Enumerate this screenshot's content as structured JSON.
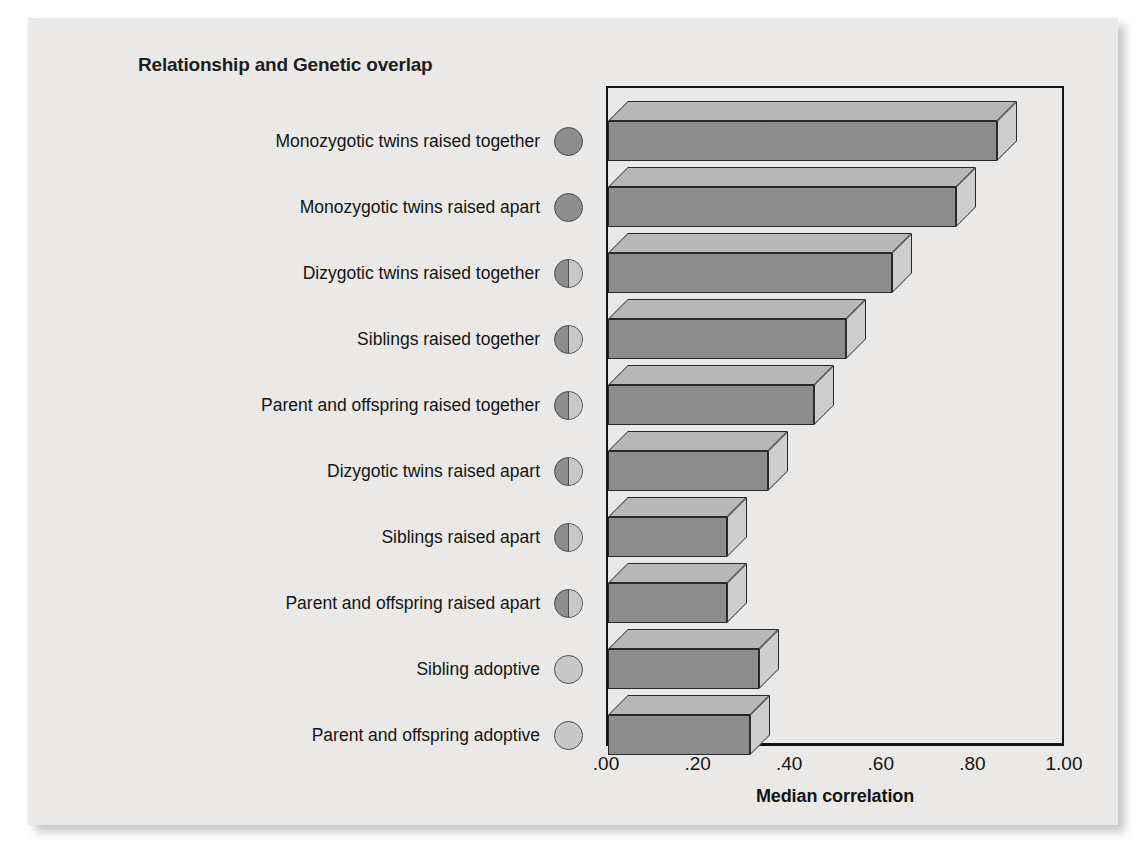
{
  "figure": {
    "legend_title": "Relationship and Genetic overlap",
    "xaxis_title": "Median correlation"
  },
  "xticks": [
    ".00",
    ".20",
    ".40",
    ".60",
    ".80",
    "1.00"
  ],
  "rows": [
    {
      "label": "Monozygotic twins raised together",
      "value": 0.85,
      "overlap": "full",
      "icon": "genetic-overlap-full-circle-icon"
    },
    {
      "label": "Monozygotic twins raised apart",
      "value": 0.76,
      "overlap": "full",
      "icon": "genetic-overlap-full-circle-icon"
    },
    {
      "label": "Dizygotic twins raised together",
      "value": 0.62,
      "overlap": "half",
      "icon": "genetic-overlap-half-circle-icon"
    },
    {
      "label": "Siblings raised together",
      "value": 0.52,
      "overlap": "half",
      "icon": "genetic-overlap-half-circle-icon"
    },
    {
      "label": "Parent and offspring raised together",
      "value": 0.45,
      "overlap": "half",
      "icon": "genetic-overlap-half-circle-icon"
    },
    {
      "label": "Dizygotic twins raised apart",
      "value": 0.35,
      "overlap": "half",
      "icon": "genetic-overlap-half-circle-icon"
    },
    {
      "label": "Siblings raised apart",
      "value": 0.26,
      "overlap": "half",
      "icon": "genetic-overlap-half-circle-icon"
    },
    {
      "label": "Parent and offspring raised apart",
      "value": 0.26,
      "overlap": "half",
      "icon": "genetic-overlap-half-circle-icon"
    },
    {
      "label": "Sibling adoptive",
      "value": 0.33,
      "overlap": "empty",
      "icon": "genetic-overlap-empty-circle-icon"
    },
    {
      "label": "Parent and offspring adoptive",
      "value": 0.31,
      "overlap": "empty",
      "icon": "genetic-overlap-empty-circle-icon"
    }
  ],
  "colors": {
    "bar_front": "#8d8d8d",
    "bar_top": "#b9b9b9",
    "bar_side": "#cfcfcf",
    "outline": "#262626",
    "paper": "#edecea",
    "circle_dark": "#8e8e8e",
    "circle_light": "#c9c9c9"
  },
  "chart_data": {
    "type": "bar",
    "orientation": "horizontal",
    "title": "Relationship and Genetic overlap",
    "xlabel": "Median correlation",
    "ylabel": "",
    "xlim": [
      0.0,
      1.0
    ],
    "xticks": [
      0.0,
      0.2,
      0.4,
      0.6,
      0.8,
      1.0
    ],
    "xticklabels": [
      ".00",
      ".20",
      ".40",
      ".60",
      ".80",
      "1.00"
    ],
    "grid": false,
    "legend": "none",
    "style": "3d-bars",
    "categories": [
      "Monozygotic twins raised together",
      "Monozygotic twins raised apart",
      "Dizygotic twins raised together",
      "Siblings raised together",
      "Parent and offspring raised together",
      "Dizygotic twins raised apart",
      "Siblings raised apart",
      "Parent and offspring raised apart",
      "Sibling adoptive",
      "Parent and offspring adoptive"
    ],
    "values": [
      0.85,
      0.76,
      0.62,
      0.52,
      0.45,
      0.35,
      0.26,
      0.26,
      0.33,
      0.31
    ],
    "genetic_overlap_markers": [
      "full",
      "full",
      "half",
      "half",
      "half",
      "half",
      "half",
      "half",
      "empty",
      "empty"
    ]
  }
}
